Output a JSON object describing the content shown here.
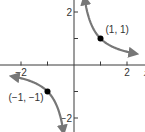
{
  "chart_data": {
    "type": "line",
    "title": "",
    "function": "y = 1/x",
    "xlabel": "x",
    "ylabel": "",
    "xlim": [
      -2.9,
      2.9
    ],
    "ylim": [
      -2.5,
      2.6
    ],
    "x_ticks": [
      -2,
      -1,
      1,
      2
    ],
    "y_ticks": [
      -2,
      -1,
      1,
      2
    ],
    "x_tick_labels": [
      {
        "value": -2,
        "label": "−2"
      },
      {
        "value": 2,
        "label": "2"
      }
    ],
    "y_tick_labels": [
      {
        "value": 2,
        "label": "2"
      },
      {
        "value": -2,
        "label": "−2"
      }
    ],
    "grid": false,
    "series": [
      {
        "name": "branch-positive",
        "x_range": [
          0.4,
          2.3
        ]
      },
      {
        "name": "branch-negative",
        "x_range": [
          -2.3,
          -0.4
        ]
      }
    ],
    "points": [
      {
        "x": 1,
        "y": 1,
        "label": "(1, 1)"
      },
      {
        "x": -1,
        "y": -1,
        "label": "(−1, −1)"
      }
    ],
    "colors": {
      "curve": "#777777",
      "axis": "#3a3a3a",
      "point": "#000000"
    }
  }
}
